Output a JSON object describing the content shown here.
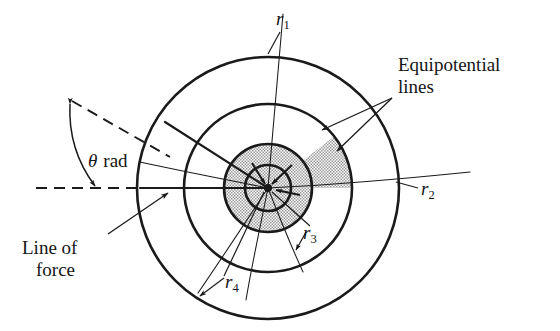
{
  "figure": {
    "background_color": "#ffffff",
    "stroke_color": "#1a1a1a",
    "shade_color": "#d6d6d6",
    "center": {
      "x": 268,
      "y": 188
    },
    "circles": [
      {
        "name": "r1",
        "radius": 23,
        "thick": true
      },
      {
        "name": "r2",
        "radius": 44,
        "thick": true
      },
      {
        "name": "r3",
        "radius": 84,
        "thick": true
      },
      {
        "name": "r4",
        "radius": 131,
        "thick": true
      }
    ],
    "field_lines_count": 6,
    "shaded_sector": {
      "from_deg": 0,
      "to_deg": 38,
      "inner_radius": 0,
      "outer_radius": 84
    },
    "theta_arc": {
      "radius": 126,
      "from_deg": 0,
      "to_deg": 38
    }
  },
  "labels": {
    "r1": {
      "symbol": "r",
      "subscript": "1"
    },
    "r2": {
      "symbol": "r",
      "subscript": "2"
    },
    "r3": {
      "symbol": "r",
      "subscript": "3"
    },
    "r4": {
      "symbol": "r",
      "subscript": "4"
    },
    "theta": {
      "symbol": "θ",
      "unit": "rad"
    },
    "equipotential": {
      "line1": "Equipotential",
      "line2": "lines"
    },
    "line_of_force": {
      "line1": "Line of",
      "line2": "force"
    }
  }
}
